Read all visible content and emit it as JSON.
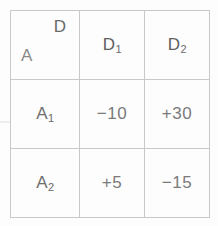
{
  "figure": {
    "type": "payoff-matrix-table",
    "corner": {
      "column_header_symbol": "D",
      "row_header_symbol": "A",
      "divider": "diagonal-line"
    },
    "column_headers": [
      {
        "base": "D",
        "sub": "1",
        "full": "D1"
      },
      {
        "base": "D",
        "sub": "2",
        "full": "D2"
      }
    ],
    "row_headers": [
      {
        "base": "A",
        "sub": "1",
        "full": "A1"
      },
      {
        "base": "A",
        "sub": "2",
        "full": "A2"
      }
    ],
    "cells": [
      [
        "−10",
        "+30"
      ],
      [
        "+5",
        "−15"
      ]
    ],
    "colors": {
      "background": "#fdfdfd",
      "border": "#c9c9c9",
      "text": "#6a6a6a",
      "value_text": "#7a7a7a",
      "hatch": "#e3e3e3",
      "diagonal": "#bfbfbf"
    }
  },
  "chart_data": {
    "type": "table",
    "title": "",
    "row_label": "A",
    "column_label": "D",
    "categories": [
      "D1",
      "D2"
    ],
    "rows": [
      "A1",
      "A2"
    ],
    "values": [
      [
        -10,
        30
      ],
      [
        5,
        -15
      ]
    ],
    "cell_labels": [
      [
        "−10",
        "+30"
      ],
      [
        "+5",
        "−15"
      ]
    ],
    "xlabel": "D",
    "ylabel": "A",
    "grid": true,
    "legend": "none"
  }
}
